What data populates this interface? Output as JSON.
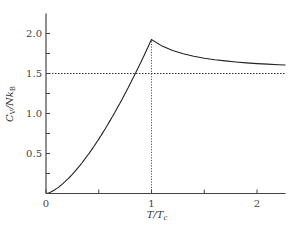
{
  "chart_data": {
    "type": "line",
    "title": "",
    "xlabel": "T/T_c",
    "ylabel": "C_V/Nk_B",
    "xlim": [
      0,
      2.27
    ],
    "ylim": [
      0,
      2.25
    ],
    "grid": false,
    "legend": null,
    "x_ticks": [
      0,
      0.5,
      1,
      1.5,
      2
    ],
    "x_tick_labels": [
      "0",
      "",
      "1",
      "",
      "2"
    ],
    "y_ticks": [
      0.25,
      0.5,
      0.75,
      1.0,
      1.25,
      1.5,
      1.75,
      2.0
    ],
    "y_tick_labels": [
      "",
      "0.5",
      "",
      "1.0",
      "",
      "1.5",
      "",
      "2.0"
    ],
    "series": [
      {
        "name": "C_V/Nk_B",
        "style": "solid",
        "x": [
          0,
          0.1,
          0.2,
          0.3,
          0.4,
          0.5,
          0.6,
          0.7,
          0.8,
          0.9,
          1.0,
          1.1,
          1.2,
          1.3,
          1.4,
          1.5,
          1.6,
          1.7,
          1.8,
          1.9,
          2.0,
          2.1,
          2.2,
          2.27
        ],
        "y": [
          0,
          0.061,
          0.172,
          0.316,
          0.487,
          0.681,
          0.895,
          1.127,
          1.377,
          1.644,
          1.925,
          1.843,
          1.787,
          1.746,
          1.715,
          1.691,
          1.672,
          1.657,
          1.644,
          1.633,
          1.624,
          1.617,
          1.61,
          1.606
        ]
      }
    ],
    "annotations": [
      {
        "type": "hline",
        "y": 1.5,
        "style": "dotted",
        "label": ""
      },
      {
        "type": "vline",
        "x": 1.0,
        "style": "dotted",
        "label": ""
      }
    ]
  }
}
